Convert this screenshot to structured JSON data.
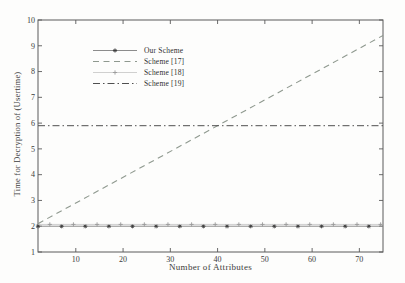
{
  "figure": {
    "kind": "scanned-plot"
  },
  "chart_data": {
    "type": "line",
    "title": "",
    "xlabel": "Number of Attributes",
    "ylabel": "Time for Decryption of (Usertime)",
    "xlim": [
      2,
      75
    ],
    "ylim": [
      1,
      10
    ],
    "xticks": [
      10,
      20,
      30,
      40,
      50,
      60,
      70
    ],
    "yticks": [
      1,
      2,
      3,
      4,
      5,
      6,
      7,
      8,
      9,
      10
    ],
    "grid": false,
    "legend_position": "upper-left",
    "axis_color": "#5a5a5a",
    "tick_label_color": "#3b3b3b",
    "series": [
      {
        "name": "Our Scheme",
        "line": "solid",
        "width": 1.0,
        "color": "#8c8c8c",
        "marker": "asterisk",
        "marker_color": "#3d3d3d",
        "marker_step": 5,
        "marker_offset": 0,
        "x": [
          2,
          75
        ],
        "y": [
          2.0,
          2.0
        ]
      },
      {
        "name": "Scheme [17]",
        "line": "dashed",
        "width": 1.1,
        "color": "#8f998f",
        "x": [
          2,
          75
        ],
        "y": [
          2.1,
          9.4
        ]
      },
      {
        "name": "Scheme [18]",
        "line": "solid",
        "width": 0.7,
        "color": "#bcbcbc",
        "marker": "plus",
        "marker_color": "#9a9a9a",
        "marker_step": 5,
        "marker_offset": 2.5,
        "x": [
          2,
          75
        ],
        "y": [
          2.07,
          2.07
        ]
      },
      {
        "name": "Scheme [19]",
        "line": "dashdot",
        "width": 1.0,
        "color": "#4f4f4f",
        "x": [
          2,
          75
        ],
        "y": [
          5.9,
          5.9
        ]
      }
    ]
  }
}
